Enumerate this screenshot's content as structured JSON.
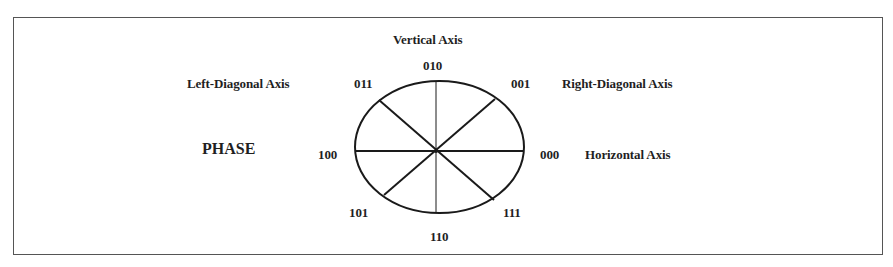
{
  "diagram": {
    "title": "PHASE",
    "axes": {
      "vertical": "Vertical Axis",
      "left_diagonal": "Left-Diagonal Axis",
      "right_diagonal": "Right-Diagonal Axis",
      "horizontal": "Horizontal Axis"
    },
    "phase_codes": {
      "top": "010",
      "top_left": "011",
      "top_right": "001",
      "left": "100",
      "right": "000",
      "bottom_left": "101",
      "bottom_right": "111",
      "bottom": "110"
    },
    "colors": {
      "stroke": "#1a1a1a",
      "frame": "#555555",
      "background": "#ffffff"
    }
  }
}
